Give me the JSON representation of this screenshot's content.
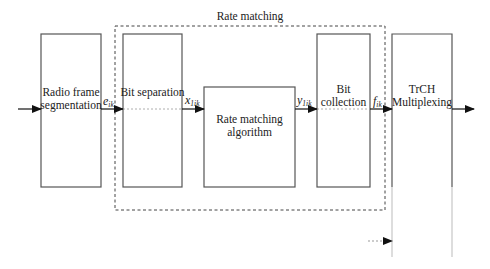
{
  "diagram": {
    "group": {
      "title": "Rate matching"
    },
    "blocks": [
      {
        "id": "radio-frame-segmentation",
        "lines": [
          "Radio frame",
          "segmentation"
        ]
      },
      {
        "id": "bit-separation",
        "lines": [
          "Bit separation"
        ]
      },
      {
        "id": "rate-matching-algorithm",
        "lines": [
          "Rate matching",
          "algorithm"
        ]
      },
      {
        "id": "bit-collection",
        "lines": [
          "Bit",
          "collection"
        ]
      },
      {
        "id": "trch-multiplexing",
        "lines": [
          "TrCH",
          "Multiplexing"
        ]
      }
    ],
    "signals": [
      {
        "base": "e",
        "sub": "ik"
      },
      {
        "base": "x",
        "sub": "1ik"
      },
      {
        "base": "y",
        "sub": "1ik"
      },
      {
        "base": "f",
        "sub": "ik"
      }
    ]
  }
}
